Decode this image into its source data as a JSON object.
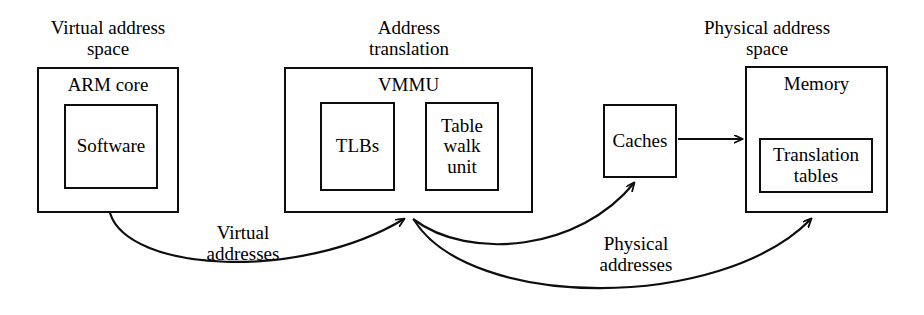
{
  "diagram": {
    "stroke_color": "#0d0d0d",
    "background_color": "#ffffff",
    "groups": [
      {
        "id": "virtual-address-space",
        "label": "Virtual address\nspace"
      },
      {
        "id": "address-translation",
        "label": "Address\ntranslation"
      },
      {
        "id": "physical-address-space",
        "label": "Physical address\nspace"
      }
    ],
    "boxes": [
      {
        "id": "arm-core",
        "title": "ARM core",
        "children": [
          {
            "id": "software",
            "label": "Software"
          }
        ]
      },
      {
        "id": "vmmu",
        "title": "VMMU",
        "children": [
          {
            "id": "tlbs",
            "label": "TLBs"
          },
          {
            "id": "table-walk-unit",
            "label": "Table\nwalk\nunit"
          }
        ]
      },
      {
        "id": "caches",
        "title": "Caches",
        "children": []
      },
      {
        "id": "memory",
        "title": "Memory",
        "children": [
          {
            "id": "translation-tables",
            "label": "Translation\ntables"
          }
        ]
      }
    ],
    "edges": [
      {
        "id": "arm-core-to-vmmu",
        "label": "Virtual\naddresses",
        "from": "arm-core",
        "to": "vmmu",
        "arrow": "to"
      },
      {
        "id": "vmmu-to-caches",
        "label": "",
        "from": "vmmu",
        "to": "caches",
        "arrow": "to"
      },
      {
        "id": "vmmu-to-memory",
        "label": "Physical\naddresses",
        "from": "vmmu",
        "to": "memory",
        "arrow": "to"
      },
      {
        "id": "caches-to-memory",
        "label": "",
        "from": "caches",
        "to": "memory",
        "arrow": "to"
      }
    ]
  }
}
